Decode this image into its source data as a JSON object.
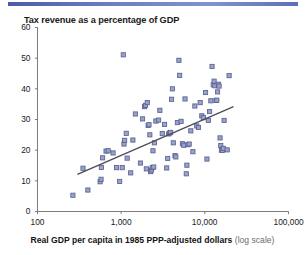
{
  "figure": {
    "title": "Tax revenue as a percentage of GDP",
    "caption_main": "Real GDP per capita in 1985 PPP-adjusted dollars",
    "caption_note": "(log scale)",
    "accent_rule_color": "#5d6fb8",
    "marker_fill_color": "#9aa3c4",
    "marker_edge_color": "#5a6196",
    "trend_line_color": "#4d4d55",
    "axis_color": "#6e6e6e"
  },
  "chart_data": {
    "type": "scatter",
    "title": "Tax revenue as a percentage of GDP",
    "xlabel": "Real GDP per capita in 1985 PPP-adjusted dollars (log scale)",
    "ylabel": "Tax revenue as a percentage of GDP",
    "xscale": "log",
    "yscale": "linear",
    "xlim": [
      100,
      100000
    ],
    "ylim": [
      0,
      60
    ],
    "xticks": [
      100,
      1000,
      10000,
      100000
    ],
    "xtick_labels": [
      "100",
      "1,000",
      "10,000",
      "100,000"
    ],
    "yticks": [
      0,
      10,
      20,
      30,
      40,
      50,
      60
    ],
    "ytick_labels": [
      "0",
      "10",
      "20",
      "30",
      "40",
      "50",
      "60"
    ],
    "grid": false,
    "legend": false,
    "series": [
      {
        "name": "Countries",
        "marker": "square",
        "points": [
          [
            265,
            5.3
          ],
          [
            400,
            7.0
          ],
          [
            560,
            9.7
          ],
          [
            575,
            10.5
          ],
          [
            580,
            14.4
          ],
          [
            600,
            17.5
          ],
          [
            660,
            19.7
          ],
          [
            700,
            19.8
          ],
          [
            800,
            19.1
          ],
          [
            350,
            14.1
          ],
          [
            880,
            14.3
          ],
          [
            960,
            9.8
          ],
          [
            1030,
            14.3
          ],
          [
            1060,
            51.1
          ],
          [
            1080,
            22.0
          ],
          [
            1100,
            23.2
          ],
          [
            1150,
            25.5
          ],
          [
            1180,
            17.4
          ],
          [
            1300,
            12.6
          ],
          [
            1380,
            23.3
          ],
          [
            1480,
            31.8
          ],
          [
            1700,
            15.8
          ],
          [
            1800,
            30.2
          ],
          [
            1900,
            34.2
          ],
          [
            1950,
            34.6
          ],
          [
            2000,
            13.9
          ],
          [
            2050,
            35.5
          ],
          [
            2100,
            28.1
          ],
          [
            2150,
            28.3
          ],
          [
            2200,
            25.0
          ],
          [
            2250,
            13.0
          ],
          [
            2300,
            13.5
          ],
          [
            2350,
            14.3
          ],
          [
            2400,
            19.8
          ],
          [
            2450,
            14.5
          ],
          [
            2500,
            22.4
          ],
          [
            2600,
            29.5
          ],
          [
            2800,
            29.8
          ],
          [
            2900,
            33.0
          ],
          [
            3100,
            25.4
          ],
          [
            3300,
            28.4
          ],
          [
            3500,
            14.2
          ],
          [
            3600,
            17.3
          ],
          [
            3700,
            25.3
          ],
          [
            3800,
            25.6
          ],
          [
            3900,
            25.8
          ],
          [
            4000,
            36.6
          ],
          [
            4100,
            40.0
          ],
          [
            4200,
            22.4
          ],
          [
            4400,
            18.2
          ],
          [
            4500,
            17.8
          ],
          [
            4700,
            29.0
          ],
          [
            4900,
            49.3
          ],
          [
            5000,
            44.4
          ],
          [
            5200,
            29.4
          ],
          [
            5400,
            22.1
          ],
          [
            5600,
            21.6
          ],
          [
            5800,
            36.7
          ],
          [
            6000,
            12.3
          ],
          [
            6100,
            15.1
          ],
          [
            6300,
            21.8
          ],
          [
            6500,
            22.0
          ],
          [
            6800,
            26.3
          ],
          [
            7200,
            19.5
          ],
          [
            7600,
            34.4
          ],
          [
            8000,
            27.9
          ],
          [
            8400,
            27.4
          ],
          [
            8800,
            35.5
          ],
          [
            9200,
            31.2
          ],
          [
            9600,
            30.6
          ],
          [
            10200,
            38.8
          ],
          [
            10600,
            17.1
          ],
          [
            11000,
            29.7
          ],
          [
            11400,
            32.6
          ],
          [
            11800,
            36.1
          ],
          [
            12200,
            47.3
          ],
          [
            12600,
            41.3
          ],
          [
            12900,
            42.5
          ],
          [
            13200,
            41.0
          ],
          [
            13600,
            36.2
          ],
          [
            13900,
            36.3
          ],
          [
            14200,
            39.0
          ],
          [
            14500,
            41.5
          ],
          [
            14800,
            40.9
          ],
          [
            15200,
            24.0
          ],
          [
            15500,
            21.5
          ],
          [
            15800,
            20.0
          ],
          [
            16200,
            19.9
          ],
          [
            16600,
            20.6
          ],
          [
            17000,
            29.7
          ],
          [
            18500,
            20.1
          ],
          [
            19500,
            44.3
          ]
        ]
      }
    ],
    "trendline": {
      "name": "Fitted regression line",
      "x_start": 300,
      "y_start": 12.1,
      "x_end": 22000,
      "y_end": 34.2
    }
  }
}
